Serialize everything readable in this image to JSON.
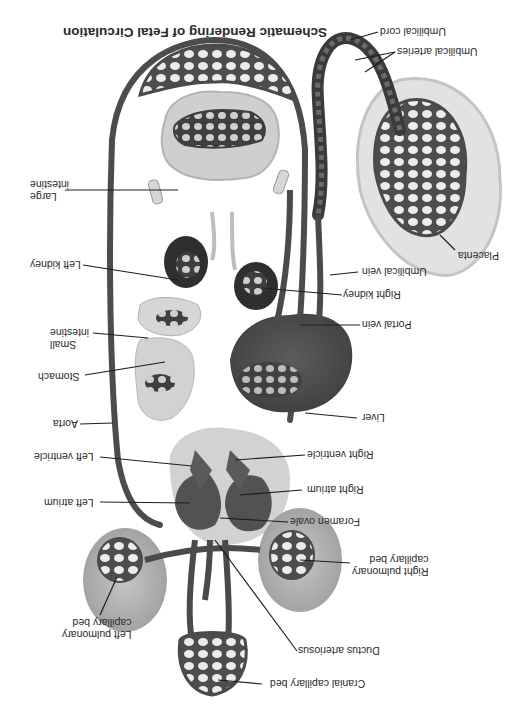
{
  "figure": {
    "title": "Schematic Rendering of Fetal Circulation",
    "orientation": "rotated 180 degrees",
    "colors": {
      "vessel": "#4a4a4a",
      "vessel_light": "#7a7a7a",
      "organ_dark": "#3d3d3d",
      "organ_mid": "#6e6e6e",
      "organ_light": "#c8c8c8",
      "placenta": "#dcdcdc",
      "lung": "#a9a9a9",
      "leader_line": "#1e1e1e",
      "text": "#2a2a2a"
    }
  },
  "labels": {
    "umbilical_cord": "Umbilical cord",
    "umbilical_arteries": "Umbilical arteries",
    "placenta": "Placenta",
    "umbilical_vein": "Umbilical vein",
    "right_kidney": "Right kidney",
    "portal_vein": "Portal vein",
    "liver": "Liver",
    "right_ventricle": "Right ventricle",
    "right_atrium": "Right atrium",
    "foramen_ovale": "Foramen ovale",
    "right_pulmonary_capillary_bed": "Right pulmonary\ncapillary bed",
    "ductus_arteriosus": "Ductus arteriosus",
    "cranial_capillary_bed": "Cranial capillary bed",
    "large_intestine": "Large\nintestine",
    "left_kidney": "Left kidney",
    "small_intestine": "Small\nintestine",
    "stomach": "Stomach",
    "aorta": "Aorta",
    "left_ventricle": "Left ventricle",
    "left_atrium": "Left atrium",
    "left_pulmonary_capillary_bed": "Left pulmonary\ncapillary bed"
  }
}
